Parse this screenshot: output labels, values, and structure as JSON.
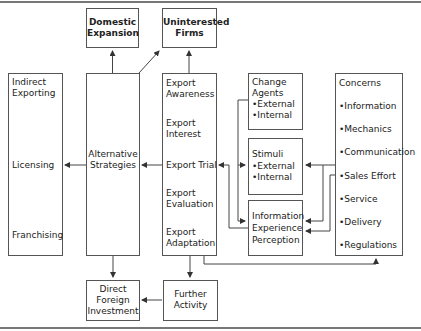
{
  "diagram": {
    "boxes": {
      "domestic_expansion": {
        "label": [
          "Domestic",
          "Expansion"
        ]
      },
      "uninterested_firms": {
        "label": [
          "Uninterested",
          "Firms"
        ]
      },
      "entry_modes": {
        "items": [
          "Indirect",
          "Exporting",
          "Licensing",
          "Franchising"
        ]
      },
      "alternative_strategies": {
        "label": [
          "Alternative",
          "Strategies"
        ]
      },
      "export_stages": {
        "items": [
          [
            "Export",
            "Awareness"
          ],
          [
            "Export",
            "Interest"
          ],
          [
            "Export Trial"
          ],
          [
            "Export",
            "Evaluation"
          ],
          [
            "Export",
            "Adaptation"
          ]
        ]
      },
      "change_agents": {
        "label": [
          "Change",
          "Agents"
        ],
        "items": [
          "•External",
          "•Internal"
        ]
      },
      "stimuli": {
        "label": [
          "Stimuli"
        ],
        "items": [
          "•External",
          "•Internal"
        ]
      },
      "information": {
        "label": [
          "Information",
          "Experience",
          "Perception"
        ]
      },
      "concerns": {
        "label": "Concerns",
        "items": [
          "•Information",
          "•Mechanics",
          "•Communication",
          "•Sales Effort",
          "•Service",
          "•Delivery",
          "•Regulations"
        ]
      },
      "direct_foreign_investment": {
        "label": [
          "Direct",
          "Foreign",
          "Investment"
        ]
      },
      "further_activity": {
        "label": [
          "Further",
          "Activity"
        ]
      }
    },
    "colors": {
      "line": "#444444",
      "border": "#555555",
      "rule": "#777777"
    }
  }
}
